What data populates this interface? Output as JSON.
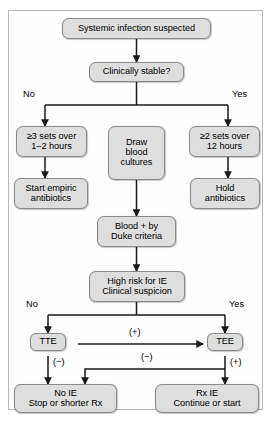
{
  "figure": {
    "type": "clinical-flowchart",
    "frame_border_color": "#b9b9b9",
    "node_fill_color": "#dedede",
    "node_border_color": "#8a8a8a",
    "connector_color": "#1a1a1a"
  },
  "nodes": {
    "systemic_infection": "Systemic infection suspected",
    "clinically_stable": "Clinically stable?",
    "three_sets": "≥3 sets over\n1–2 hours",
    "draw_cultures": "Draw\nblood\ncultures",
    "two_sets": "≥2 sets over\n12 hours",
    "start_empiric": "Start empiric\nantibiotics",
    "hold_antibiotics": "Hold\nantibiotics",
    "blood_duke": "Blood + by\nDuke criteria",
    "high_risk": "High risk for IE\nClinical suspicion",
    "tte": "TTE",
    "tee": "TEE",
    "no_ie": "No IE\nStop or shorter Rx",
    "rx_ie": "Rx IE\nContinue or start"
  },
  "edge_labels": {
    "stable_no": "No",
    "stable_yes": "Yes",
    "risk_no": "No",
    "risk_yes": "Yes",
    "tte_positive": "(+)",
    "tte_negative": "(−)",
    "tee_negative": "(−)",
    "tee_positive": "(+)"
  }
}
